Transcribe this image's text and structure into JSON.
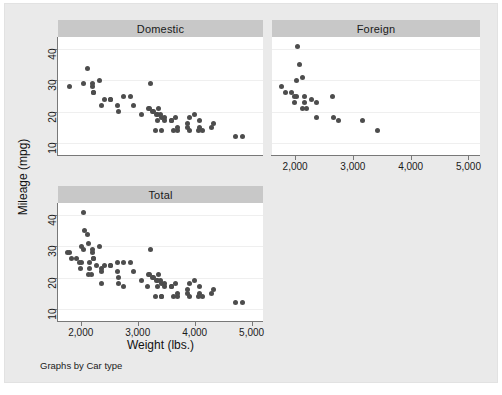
{
  "graph": {
    "note": "Graphs by Car type",
    "y_axis_title": "Mileage (mpg)",
    "x_axis_title": "Weight (lbs.)",
    "bg_color": "#eaeaea",
    "plot_bg_color": "#ffffff",
    "title_band_color": "#c8c8c8",
    "marker_color": "#4d4d4d",
    "axis_color": "#787878",
    "grid_color": "#efefef"
  },
  "panels": [
    {
      "id": "domestic",
      "title": "Domestic"
    },
    {
      "id": "foreign",
      "title": "Foreign"
    },
    {
      "id": "total",
      "title": "Total"
    }
  ],
  "axes": {
    "y_ticks": [
      10,
      20,
      30,
      40
    ],
    "y_tick_labels": [
      "10",
      "20",
      "30",
      "40"
    ],
    "y_min": 6,
    "y_max": 44,
    "x_ticks": [
      2000,
      3000,
      4000,
      5000
    ],
    "x_tick_labels": [
      "2,000",
      "3,000",
      "4,000",
      "5,000"
    ],
    "x_min": 1600,
    "x_max": 5200
  },
  "chart_data": {
    "type": "scatter",
    "title": "",
    "subtitle": "",
    "xlabel": "Weight (lbs.)",
    "ylabel": "Mileage (mpg)",
    "note": "Graphs by Car type",
    "xlim": [
      1600,
      5200
    ],
    "ylim": [
      6,
      44
    ],
    "xticks": [
      2000,
      3000,
      4000,
      5000
    ],
    "xticklabels": [
      "2,000",
      "3,000",
      "4,000",
      "5,000"
    ],
    "yticks": [
      10,
      20,
      30,
      40
    ],
    "yticklabels": [
      "10",
      "20",
      "30",
      "40"
    ],
    "grid": "horizontal",
    "legend": "none",
    "panel_layout": "by-group small multiples (Domestic, Foreign, Total)",
    "panels": [
      {
        "name": "Domestic",
        "n": 52,
        "x": [
          2930,
          3350,
          2640,
          3250,
          4080,
          3670,
          2230,
          3280,
          3880,
          3400,
          3310,
          3690,
          3180,
          3220,
          4330,
          3900,
          4290,
          4080,
          3350,
          3200,
          4000,
          2520,
          2870,
          3420,
          3690,
          3470,
          3600,
          3330,
          3070,
          3620,
          3410,
          2200,
          2520,
          2330,
          2110,
          2750,
          3470,
          3880,
          3900,
          4060,
          3360,
          2050,
          2410,
          2200,
          2670,
          2230,
          2370,
          3600,
          4130,
          4840,
          4720,
          1800
        ],
        "y": [
          22,
          17,
          22,
          20,
          15,
          18,
          26,
          20,
          16,
          19,
          14,
          14,
          21,
          29,
          16,
          18,
          15,
          17,
          19,
          21,
          19,
          24,
          25,
          18,
          15,
          17,
          17,
          19,
          19,
          14,
          14,
          28,
          24,
          30,
          34,
          25,
          18,
          15,
          14,
          14,
          21,
          29,
          24,
          29,
          20,
          26,
          22,
          17,
          14,
          12,
          12,
          28
        ],
        "color": "#4d4d4d"
      },
      {
        "name": "Foreign",
        "n": 22,
        "x": [
          2070,
          2020,
          2130,
          1760,
          1980,
          2670,
          2750,
          1990,
          3170,
          2160,
          2040,
          2160,
          2370,
          2020,
          2280,
          1930,
          2370,
          2130,
          2650,
          1830,
          2190,
          3420
        ],
        "y": [
          35,
          25,
          21,
          28,
          25,
          18,
          17,
          23,
          17,
          23,
          41,
          25,
          18,
          30,
          24,
          26,
          23,
          31,
          25,
          26,
          21,
          14
        ],
        "color": "#4d4d4d"
      },
      {
        "name": "Total",
        "n": 74,
        "x": [
          2930,
          3350,
          2640,
          3250,
          4080,
          3670,
          2230,
          3280,
          3880,
          3400,
          3310,
          3690,
          3180,
          3220,
          4330,
          3900,
          4290,
          4080,
          3350,
          3200,
          4000,
          2520,
          2870,
          3420,
          3690,
          3470,
          3600,
          3330,
          3070,
          3620,
          3410,
          2200,
          2520,
          2330,
          2110,
          2750,
          3470,
          3880,
          3900,
          4060,
          3360,
          2050,
          2410,
          2200,
          2670,
          2230,
          2370,
          3600,
          4130,
          4840,
          4720,
          1800,
          2070,
          2020,
          2130,
          1760,
          1980,
          2670,
          2750,
          1990,
          3170,
          2160,
          2040,
          2160,
          2370,
          2020,
          2280,
          1930,
          2370,
          2130,
          2650,
          1830,
          2190,
          3420
        ],
        "y": [
          22,
          17,
          22,
          20,
          15,
          18,
          26,
          20,
          16,
          19,
          14,
          14,
          21,
          29,
          16,
          18,
          15,
          17,
          19,
          21,
          19,
          24,
          25,
          18,
          15,
          17,
          17,
          19,
          19,
          14,
          14,
          28,
          24,
          30,
          34,
          25,
          18,
          15,
          14,
          14,
          21,
          29,
          24,
          29,
          20,
          26,
          22,
          17,
          14,
          12,
          12,
          28,
          35,
          25,
          21,
          28,
          25,
          18,
          17,
          23,
          17,
          23,
          41,
          25,
          18,
          30,
          24,
          26,
          23,
          31,
          25,
          26,
          21,
          14
        ],
        "color": "#4d4d4d"
      }
    ]
  }
}
